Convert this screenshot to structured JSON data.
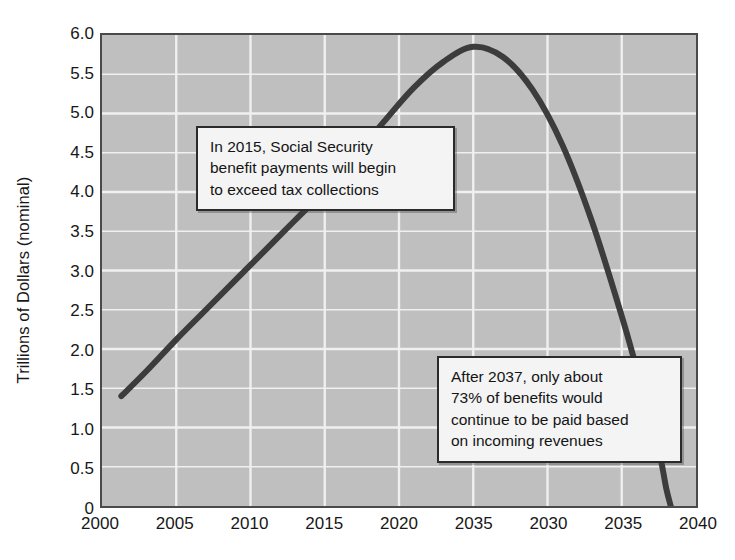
{
  "chart_data": {
    "type": "line",
    "title": "",
    "subtitle": "",
    "xlabel": "",
    "ylabel": "Trillions of Dollars (nominal)",
    "xlim": [
      2000,
      2040
    ],
    "ylim": [
      0,
      6.0
    ],
    "grid": true,
    "legend": null,
    "legend_position": "none",
    "x_tick_labels": [
      "2000",
      "2005",
      "2010",
      "2015",
      "2020",
      "2035",
      "2030",
      "2035",
      "2040"
    ],
    "x_tick_values": [
      2000,
      2005,
      2010,
      2015,
      2020,
      2025,
      2030,
      2035,
      2040
    ],
    "y_tick_labels": [
      "0",
      "0.5",
      "1.0",
      "1.5",
      "2.0",
      "2.5",
      "3.0",
      "3.5",
      "4.0",
      "4.5",
      "5.0",
      "5.5",
      "6.0"
    ],
    "y_tick_values": [
      0,
      0.5,
      1.0,
      1.5,
      2.0,
      2.5,
      3.0,
      3.5,
      4.0,
      4.5,
      5.0,
      5.5,
      6.0
    ],
    "series": [
      {
        "name": "Social Security benefit payments (nominal)",
        "color": "#3c3c3c",
        "x": [
          2001.3,
          2003,
          2005,
          2007,
          2009,
          2011,
          2013,
          2015,
          2017,
          2019,
          2021,
          2023,
          2025,
          2027,
          2029,
          2031,
          2033,
          2035,
          2036,
          2037,
          2037.6,
          2038,
          2038.3
        ],
        "y": [
          1.4,
          1.72,
          2.12,
          2.5,
          2.88,
          3.26,
          3.64,
          4.02,
          4.45,
          4.9,
          5.33,
          5.66,
          5.85,
          5.72,
          5.3,
          4.6,
          3.62,
          2.42,
          1.75,
          1.05,
          0.62,
          0.22,
          0.0
        ]
      }
    ],
    "annotations": [
      {
        "id": "callout-2015",
        "lines": [
          "In 2015, Social Security",
          "benefit payments will begin",
          "to exceed tax collections"
        ]
      },
      {
        "id": "callout-2037",
        "lines": [
          "After 2037, only about",
          "73% of benefits would",
          "continue to be paid based",
          "on incoming revenues"
        ]
      }
    ],
    "colors": {
      "plot_background": "#bfbfbf",
      "gridline": "#f0f0f0",
      "axis_border": "#4a4a4a",
      "line": "#3c3c3c",
      "callout_background": "#f4f4f4",
      "callout_border": "#2b2b2b",
      "text": "#171717"
    }
  }
}
